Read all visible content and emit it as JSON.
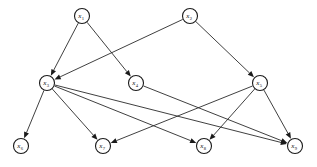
{
  "figure": {
    "name": "directed-acyclic-graph",
    "background_color": "#ffffff",
    "node_fill": "#ffffff",
    "node_stroke": "#1a1a1a",
    "edge_color": "#2a2a2a"
  },
  "graph": {
    "type": "directed-graph",
    "node_radius": 7.5,
    "nodes": [
      {
        "id": "x1",
        "label": "x",
        "sub": "1",
        "x": 82,
        "y": 16
      },
      {
        "id": "x2",
        "label": "x",
        "sub": "2",
        "x": 190,
        "y": 16
      },
      {
        "id": "x3",
        "label": "x",
        "sub": "3",
        "x": 47,
        "y": 83
      },
      {
        "id": "x4",
        "label": "x",
        "sub": "4",
        "x": 136,
        "y": 83
      },
      {
        "id": "x5",
        "label": "x",
        "sub": "5",
        "x": 260,
        "y": 83
      },
      {
        "id": "x6",
        "label": "x",
        "sub": "6",
        "x": 21,
        "y": 146
      },
      {
        "id": "x7",
        "label": "x",
        "sub": "7",
        "x": 103,
        "y": 146
      },
      {
        "id": "x8",
        "label": "x",
        "sub": "8",
        "x": 204,
        "y": 146
      },
      {
        "id": "x9",
        "label": "x",
        "sub": "9",
        "x": 295,
        "y": 146
      }
    ],
    "edges": [
      {
        "from": "x1",
        "to": "x3"
      },
      {
        "from": "x1",
        "to": "x4"
      },
      {
        "from": "x2",
        "to": "x3"
      },
      {
        "from": "x2",
        "to": "x5"
      },
      {
        "from": "x3",
        "to": "x6"
      },
      {
        "from": "x3",
        "to": "x7"
      },
      {
        "from": "x3",
        "to": "x8"
      },
      {
        "from": "x3",
        "to": "x9"
      },
      {
        "from": "x4",
        "to": "x9"
      },
      {
        "from": "x5",
        "to": "x7"
      },
      {
        "from": "x5",
        "to": "x8"
      },
      {
        "from": "x5",
        "to": "x9"
      }
    ]
  }
}
